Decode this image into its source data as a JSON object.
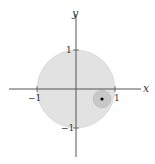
{
  "diagram": {
    "type": "unit-disk-with-neighborhood",
    "axes": {
      "x_label": "x",
      "y_label": "y"
    },
    "ticks": {
      "x_pos": "1",
      "x_neg": "−1",
      "y_pos": "1",
      "y_neg": "−1"
    },
    "colors": {
      "background": "#ffffff",
      "axis": "#555555",
      "unit_disk_fill": "#e2e2e2",
      "neighborhood_fill": "#c8c8c8",
      "point": "#000000"
    },
    "unit_disk": {
      "center": [
        0,
        0
      ],
      "radius": 1
    },
    "neighborhood": {
      "center": [
        0.67,
        -0.26
      ],
      "radius": 0.23
    },
    "point": {
      "coords": [
        0.67,
        -0.26
      ]
    }
  }
}
